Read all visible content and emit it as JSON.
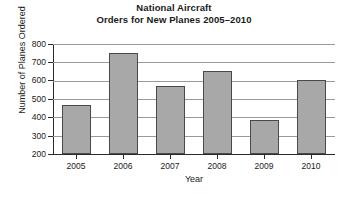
{
  "chart_data": {
    "type": "bar",
    "title_lines": [
      "National Aircraft",
      "Orders for New Planes 2005–2010"
    ],
    "categories": [
      "2005",
      "2006",
      "2007",
      "2008",
      "2009",
      "2010"
    ],
    "values": [
      470,
      750,
      570,
      655,
      385,
      605
    ],
    "series": [
      {
        "name": "Number of Planes Ordered",
        "values": [
          470,
          750,
          570,
          655,
          385,
          605
        ]
      }
    ],
    "xlabel": "Year",
    "ylabel": "Number of Planes Ordered",
    "ylim": [
      200,
      800
    ],
    "yticks": [
      200,
      300,
      400,
      500,
      600,
      700,
      800
    ],
    "ytick_labels": [
      "200",
      "300",
      "400",
      "500",
      "600",
      "700",
      "800"
    ],
    "ytick_interval": 100,
    "xtick_labels": [
      "2005",
      "2006",
      "2007",
      "2008",
      "2009",
      "2010"
    ],
    "grid": "horizontal",
    "legend": "none",
    "bar_color": "#a8a8a8",
    "bar_border_color": "#4a4a4a",
    "grid_color": "#9a9a9a",
    "axis_color": "#2b2b2b",
    "background_color": "#ffffff",
    "annotations": []
  }
}
